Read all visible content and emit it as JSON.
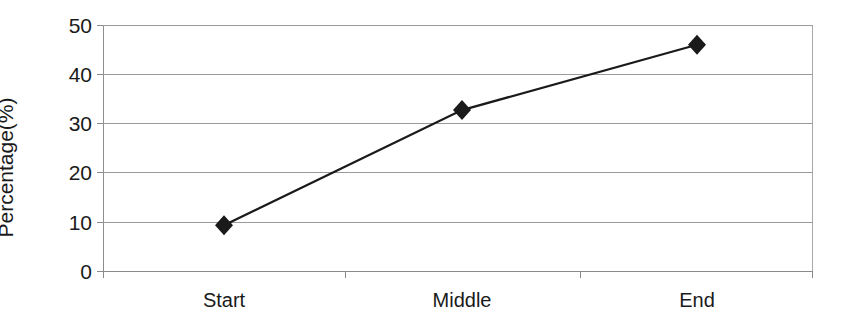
{
  "chart_data": {
    "type": "line",
    "title": "",
    "subtitle": "",
    "xlabel": "",
    "ylabel": "Percentage(%)",
    "categories": [
      "Start",
      "Middle",
      "End"
    ],
    "values": [
      9.3,
      32.7,
      46.0
    ],
    "series": [
      {
        "name": "Percentage",
        "values": [
          9.3,
          32.7,
          46.0
        ]
      }
    ],
    "ylim": [
      0,
      50
    ],
    "yticks": [
      0,
      10,
      20,
      30,
      40,
      50
    ],
    "ytick_labels": [
      "0",
      "10",
      "20",
      "30",
      "40",
      "50"
    ],
    "grid": true,
    "grid_axis": "y",
    "legend": false,
    "legend_position": "none",
    "marker": "diamond",
    "marker_color": "#1a1a1a",
    "line_color": "#1a1a1a",
    "gridline_color": "#9a9a9a",
    "background_color": "#ffffff"
  }
}
